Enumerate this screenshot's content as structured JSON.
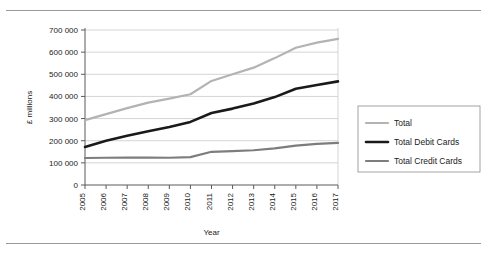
{
  "chart_data": {
    "type": "line",
    "title": "",
    "xlabel": "Year",
    "ylabel": "£ millions",
    "categories": [
      "2005",
      "2006",
      "2007",
      "2008",
      "2009",
      "2010",
      "2011",
      "2012",
      "2013",
      "2014",
      "2015",
      "2016",
      "2017"
    ],
    "x": [
      2005,
      2006,
      2007,
      2008,
      2009,
      2010,
      2011,
      2012,
      2013,
      2014,
      2015,
      2016,
      2017
    ],
    "xlim": [
      2005,
      2017
    ],
    "ylim": [
      0,
      700000
    ],
    "ytick_labels": [
      "0",
      "100 000",
      "200 000",
      "300 000",
      "400 000",
      "500 000",
      "600 000",
      "700 000"
    ],
    "ytick_values": [
      0,
      100000,
      200000,
      300000,
      400000,
      500000,
      600000,
      700000
    ],
    "grid": true,
    "legend_position": "right",
    "series": [
      {
        "name": "Total",
        "color": "#b3b3b3",
        "width": 2.2,
        "values": [
          293000,
          320000,
          347000,
          372000,
          390000,
          410000,
          470000,
          500000,
          530000,
          573000,
          620000,
          643000,
          660000
        ]
      },
      {
        "name": "Total Debit Cards",
        "color": "#1a1a1a",
        "width": 2.6,
        "values": [
          172000,
          200000,
          222000,
          243000,
          262000,
          285000,
          325000,
          345000,
          368000,
          397000,
          435000,
          452000,
          468000
        ]
      },
      {
        "name": "Total Credit Cards",
        "color": "#7d7d7d",
        "width": 2.2,
        "values": [
          122000,
          123000,
          124000,
          124000,
          123000,
          126000,
          150000,
          153000,
          157000,
          165000,
          178000,
          186000,
          190000
        ]
      }
    ]
  },
  "legend": {
    "items": [
      {
        "label": "Total"
      },
      {
        "label": "Total Debit Cards"
      },
      {
        "label": "Total Credit Cards"
      }
    ]
  }
}
